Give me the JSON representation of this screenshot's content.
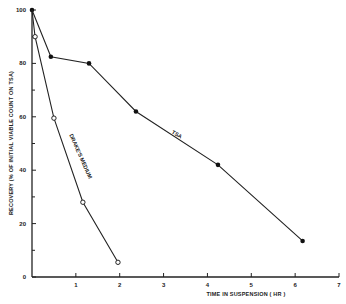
{
  "chart_data": {
    "type": "line",
    "title": "",
    "xlabel": "TIME IN SUSPENSION ( HR )",
    "ylabel": "RECOVERY (% OF INITIAL VIABLE COUNT ON TSA)",
    "xlim": [
      0,
      7
    ],
    "ylim": [
      0,
      100
    ],
    "x_ticks": [
      1,
      2,
      3,
      4,
      5,
      6,
      7
    ],
    "y_ticks_labeled": [
      0,
      20,
      40,
      60,
      80,
      100
    ],
    "y_ticks_minor": [
      10,
      30,
      50,
      70,
      90
    ],
    "grid": false,
    "legend": "inline labels",
    "series": [
      {
        "name": "TSA",
        "marker": "filled-circle",
        "x": [
          0,
          0.43,
          1.3,
          2.37,
          4.24,
          6.17
        ],
        "y": [
          100,
          82.5,
          80,
          62,
          42,
          13.5
        ]
      },
      {
        "name": "DRAKE'S MEDIUM",
        "marker": "open-circle",
        "x": [
          0,
          0.07,
          0.5,
          1.16,
          1.96
        ],
        "y": [
          100,
          90,
          59.5,
          28,
          5.5
        ]
      }
    ]
  }
}
